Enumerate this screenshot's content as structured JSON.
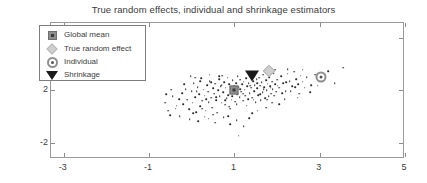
{
  "chart_data": {
    "type": "scatter",
    "title": "True random effects, individual and shrinkage estimators",
    "xlabel": "",
    "ylabel": "",
    "xlim": [
      -3.3,
      5.0
    ],
    "ylim": [
      -3.2,
      7.1
    ],
    "xticks": [
      -3,
      -1,
      1,
      3,
      5
    ],
    "xtick_labels": [
      "-3",
      "-1",
      "1",
      "3",
      "5"
    ],
    "yticks": [
      6,
      2,
      -2
    ],
    "ytick_labels": [
      "6",
      "2",
      "-2"
    ],
    "grid": false,
    "legend_position": "upper-left",
    "legend": [
      {
        "label": "Global mean",
        "marker": "square-dot",
        "color": "#8e8e8e"
      },
      {
        "label": "True random effect",
        "marker": "diamond",
        "color": "#cfcfcf"
      },
      {
        "label": "Individual",
        "marker": "circle-ring",
        "color": "#8e8e8e"
      },
      {
        "label": "Shrinkage",
        "marker": "triangle-down",
        "color": "#1b1b1b"
      }
    ],
    "series": [
      {
        "name": "Data points",
        "marker": "dot",
        "color": "#2a2a2a",
        "points": [
          [
            -0.55,
            0.45
          ],
          [
            -0.5,
            0.1
          ],
          [
            -0.38,
            0.62
          ],
          [
            -0.3,
            1.35
          ],
          [
            -0.28,
            0.05
          ],
          [
            -0.22,
            1.8
          ],
          [
            -0.2,
            0.95
          ],
          [
            -0.14,
            2.1
          ],
          [
            -0.1,
            1.3
          ],
          [
            -0.06,
            0.55
          ],
          [
            0.0,
            1.95
          ],
          [
            0.02,
            1.05
          ],
          [
            0.05,
            2.55
          ],
          [
            0.08,
            1.5
          ],
          [
            0.1,
            0.35
          ],
          [
            0.14,
            2.25
          ],
          [
            0.17,
            1.7
          ],
          [
            0.2,
            0.8
          ],
          [
            0.22,
            2.9
          ],
          [
            0.25,
            1.2
          ],
          [
            0.28,
            2.05
          ],
          [
            0.3,
            1.6
          ],
          [
            0.33,
            0.45
          ],
          [
            0.36,
            2.4
          ],
          [
            0.38,
            1.9
          ],
          [
            0.4,
            1.1
          ],
          [
            0.42,
            2.7
          ],
          [
            0.45,
            1.45
          ],
          [
            0.48,
            0.7
          ],
          [
            0.5,
            2.15
          ],
          [
            0.52,
            1.75
          ],
          [
            0.55,
            2.5
          ],
          [
            0.57,
            1.25
          ],
          [
            0.6,
            0.3
          ],
          [
            0.62,
            2.0
          ],
          [
            0.64,
            2.85
          ],
          [
            0.66,
            1.55
          ],
          [
            0.68,
            2.3
          ],
          [
            0.7,
            1.05
          ],
          [
            0.72,
            3.1
          ],
          [
            0.74,
            1.85
          ],
          [
            0.76,
            2.6
          ],
          [
            0.78,
            0.9
          ],
          [
            0.8,
            2.2
          ],
          [
            0.82,
            1.4
          ],
          [
            0.84,
            2.95
          ],
          [
            0.86,
            1.65
          ],
          [
            0.88,
            2.45
          ],
          [
            0.9,
            0.6
          ],
          [
            0.92,
            2.1
          ],
          [
            0.94,
            1.3
          ],
          [
            0.96,
            2.75
          ],
          [
            0.98,
            1.95
          ],
          [
            1.0,
            2.35
          ],
          [
            1.02,
            1.15
          ],
          [
            1.04,
            2.55
          ],
          [
            1.06,
            1.7
          ],
          [
            1.08,
            3.05
          ],
          [
            1.1,
            2.25
          ],
          [
            1.12,
            1.5
          ],
          [
            1.14,
            2.8
          ],
          [
            1.16,
            1.9
          ],
          [
            1.18,
            2.45
          ],
          [
            1.2,
            1.2
          ],
          [
            1.22,
            2.65
          ],
          [
            1.24,
            2.05
          ],
          [
            1.26,
            1.6
          ],
          [
            1.28,
            2.9
          ],
          [
            1.3,
            2.3
          ],
          [
            1.32,
            1.35
          ],
          [
            1.34,
            2.55
          ],
          [
            1.36,
            1.8
          ],
          [
            1.38,
            3.15
          ],
          [
            1.4,
            2.2
          ],
          [
            1.42,
            1.45
          ],
          [
            1.44,
            2.7
          ],
          [
            1.46,
            1.95
          ],
          [
            1.48,
            2.4
          ],
          [
            1.5,
            1.1
          ],
          [
            1.52,
            2.85
          ],
          [
            1.54,
            2.15
          ],
          [
            1.56,
            1.65
          ],
          [
            1.58,
            2.95
          ],
          [
            1.6,
            2.35
          ],
          [
            1.62,
            1.25
          ],
          [
            1.64,
            2.6
          ],
          [
            1.66,
            1.85
          ],
          [
            1.68,
            3.2
          ],
          [
            1.7,
            2.25
          ],
          [
            1.72,
            1.4
          ],
          [
            1.74,
            2.75
          ],
          [
            1.76,
            2.0
          ],
          [
            1.78,
            2.5
          ],
          [
            1.8,
            1.55
          ],
          [
            1.82,
            3.0
          ],
          [
            1.84,
            2.3
          ],
          [
            1.86,
            1.75
          ],
          [
            1.88,
            2.65
          ],
          [
            1.9,
            2.1
          ],
          [
            1.92,
            3.3
          ],
          [
            1.95,
            2.45
          ],
          [
            1.98,
            1.9
          ],
          [
            2.0,
            2.8
          ],
          [
            2.05,
            2.2
          ],
          [
            2.1,
            3.05
          ],
          [
            2.15,
            2.55
          ],
          [
            2.2,
            1.95
          ],
          [
            2.25,
            3.25
          ],
          [
            2.3,
            2.7
          ],
          [
            2.35,
            2.3
          ],
          [
            2.4,
            3.4
          ],
          [
            2.45,
            2.85
          ],
          [
            2.5,
            2.45
          ],
          [
            2.55,
            3.1
          ],
          [
            2.6,
            2.65
          ],
          [
            2.7,
            3.0
          ],
          [
            2.8,
            2.4
          ],
          [
            2.9,
            3.2
          ],
          [
            3.05,
            2.9
          ],
          [
            3.2,
            3.45
          ],
          [
            3.55,
            3.7
          ],
          [
            -0.62,
            1.05
          ],
          [
            -0.45,
            1.55
          ],
          [
            -0.35,
            0.85
          ],
          [
            -0.18,
            2.45
          ],
          [
            0.04,
            0.25
          ],
          [
            0.12,
            1.95
          ],
          [
            0.24,
            0.6
          ],
          [
            0.34,
            1.35
          ],
          [
            0.46,
            2.6
          ],
          [
            0.58,
            1.5
          ],
          [
            0.7,
            2.4
          ],
          [
            0.79,
            1.25
          ],
          [
            0.88,
            0.75
          ],
          [
            0.95,
            1.55
          ],
          [
            1.05,
            0.95
          ],
          [
            1.13,
            2.1
          ],
          [
            1.21,
            1.75
          ],
          [
            1.29,
            0.85
          ],
          [
            1.37,
            2.35
          ],
          [
            1.45,
            1.3
          ],
          [
            1.53,
            2.55
          ],
          [
            1.61,
            1.7
          ],
          [
            1.69,
            2.1
          ],
          [
            1.77,
            1.3
          ],
          [
            1.85,
            2.2
          ],
          [
            1.93,
            1.6
          ],
          [
            2.02,
            2.35
          ],
          [
            2.12,
            1.8
          ],
          [
            2.22,
            2.6
          ],
          [
            2.32,
            1.95
          ],
          [
            2.42,
            2.25
          ],
          [
            2.52,
            1.75
          ],
          [
            2.65,
            2.2
          ],
          [
            2.78,
            1.85
          ],
          [
            2.95,
            2.35
          ],
          [
            -0.05,
            -0.2
          ],
          [
            0.15,
            -0.35
          ],
          [
            0.4,
            -0.15
          ],
          [
            0.55,
            -0.45
          ],
          [
            0.75,
            -0.05
          ],
          [
            0.9,
            -0.55
          ],
          [
            1.05,
            -0.25
          ],
          [
            1.22,
            -0.7
          ],
          [
            1.35,
            -0.1
          ],
          [
            1.1,
            -1.45
          ],
          [
            0.65,
            3.05
          ],
          [
            0.42,
            3.2
          ],
          [
            0.2,
            2.7
          ],
          [
            -0.02,
            3.05
          ],
          [
            1.95,
            3.55
          ],
          [
            2.25,
            3.6
          ],
          [
            2.6,
            3.55
          ],
          [
            3.35,
            2.55
          ],
          [
            0.3,
            0.0
          ],
          [
            0.85,
            0.05
          ],
          [
            -0.48,
            2.05
          ],
          [
            -0.6,
            1.7
          ],
          [
            1.55,
            0.45
          ],
          [
            1.75,
            0.7
          ],
          [
            2.05,
            0.95
          ],
          [
            1.42,
            0.25
          ],
          [
            0.5,
            0.15
          ],
          [
            1.88,
            1.05
          ],
          [
            2.18,
            1.35
          ],
          [
            2.48,
            1.45
          ],
          [
            0.08,
            2.95
          ],
          [
            1.32,
            3.35
          ]
        ]
      }
    ],
    "highlight_markers": [
      {
        "name": "Global mean",
        "marker": "square-dot",
        "x": 1.0,
        "y": 2.05
      },
      {
        "name": "True random effect",
        "marker": "diamond",
        "x": 1.8,
        "y": 3.5
      },
      {
        "name": "Individual",
        "marker": "circle-ring",
        "x": 3.03,
        "y": 3.0
      },
      {
        "name": "Shrinkage",
        "marker": "triangle-down",
        "x": 1.41,
        "y": 3.05
      }
    ]
  }
}
